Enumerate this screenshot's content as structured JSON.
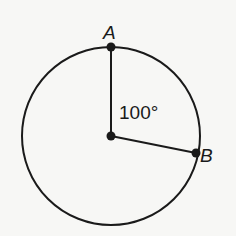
{
  "diagram": {
    "type": "circle-central-angle",
    "circle": {
      "cx": 111,
      "cy": 136,
      "r": 89
    },
    "center": {
      "x": 111,
      "y": 136
    },
    "points": [
      {
        "name": "A",
        "x": 111,
        "y": 47,
        "label_x": 110,
        "label_y": 39
      },
      {
        "name": "B",
        "x": 196,
        "y": 153,
        "label_x": 201,
        "label_y": 162
      }
    ],
    "angle_label": "100°",
    "angle_label_pos": {
      "x": 118,
      "y": 119
    },
    "stroke_color": "#1a1a1a",
    "background": "#f7f7f5"
  }
}
